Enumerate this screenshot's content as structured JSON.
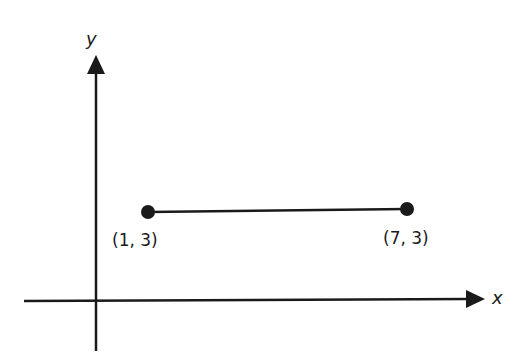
{
  "diagram": {
    "type": "coordinate-plane-segment",
    "axes": {
      "x_label": "x",
      "y_label": "y"
    },
    "points": [
      {
        "label": "(1, 3)",
        "x": 1,
        "y": 3
      },
      {
        "label": "(7, 3)",
        "x": 7,
        "y": 3
      }
    ],
    "segment": {
      "from": "(1, 3)",
      "to": "(7, 3)"
    },
    "colors": {
      "ink": "#1a1a1a",
      "background": "#ffffff"
    }
  }
}
